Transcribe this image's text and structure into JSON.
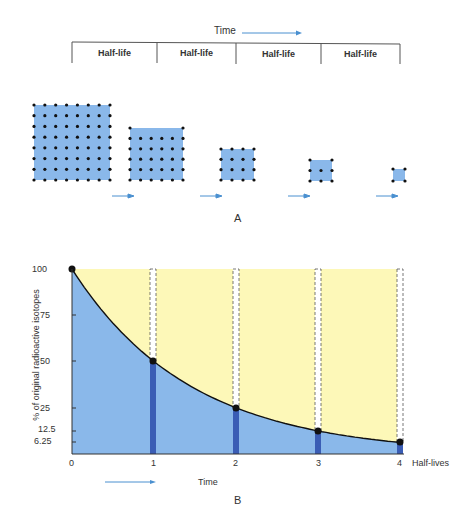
{
  "panel_a": {
    "label": "A",
    "time_label": "Time",
    "half_life_headers": [
      "Half-life",
      "Half-life",
      "Half-life",
      "Half-life"
    ],
    "squares": [
      {
        "x": 34,
        "y": 105,
        "w": 76,
        "h": 75,
        "dots": 64
      },
      {
        "x": 130,
        "y": 128,
        "w": 53,
        "h": 52,
        "dots": 32
      },
      {
        "x": 220,
        "y": 148,
        "w": 34,
        "h": 32,
        "dots": 16
      },
      {
        "x": 310,
        "y": 160,
        "w": 22,
        "h": 21,
        "dots": 8
      },
      {
        "x": 393,
        "y": 169,
        "w": 12,
        "h": 12,
        "dots": 4
      }
    ]
  },
  "panel_b": {
    "label": "B",
    "time_label": "Time",
    "y_axis_label": "% of original radioactive isotopes",
    "x_axis_label": "Half-lives"
  },
  "colors": {
    "square_fill": "#8ab8ea",
    "dot": "#111111",
    "arrow": "#4a90d0",
    "curve_area": "#8ab8ea",
    "remaining_area": "#fdf8b8",
    "bar": "#3a5db5"
  },
  "chart_data": {
    "type": "line",
    "title": "",
    "xlabel": "Half-lives",
    "ylabel": "% of original radioactive isotopes",
    "x": [
      0,
      1,
      2,
      3,
      4
    ],
    "values": [
      100,
      50,
      25,
      12.5,
      6.25
    ],
    "x_ticks": [
      "0",
      "1",
      "2",
      "3",
      "4"
    ],
    "y_ticks": [
      "100",
      "75",
      "50",
      "25",
      "12.5",
      "6.25"
    ],
    "xlim": [
      0,
      4
    ],
    "ylim": [
      0,
      100
    ],
    "grid": false,
    "annotations": [
      "Time →",
      "B"
    ]
  }
}
